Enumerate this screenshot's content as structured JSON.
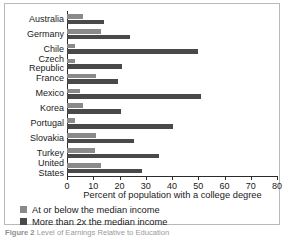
{
  "caption": {
    "prefix": "Figure 2",
    "text": " Level of Earnings Relative to Education"
  },
  "legend": {
    "items": [
      {
        "label": "At or below the median income",
        "color": "#8a8a8a",
        "swatch_name": "legend-swatch-at-or-below"
      },
      {
        "label": "More than 2x the median income",
        "color": "#494949",
        "swatch_name": "legend-swatch-more-than-2x"
      }
    ]
  },
  "chart_data": {
    "type": "bar",
    "orientation": "horizontal",
    "title": "",
    "xlabel": "Percent of population with a college degree",
    "ylabel": "",
    "xlim": [
      0,
      80
    ],
    "xticks": [
      0,
      10,
      20,
      30,
      40,
      50,
      60,
      70,
      80
    ],
    "xtick_labels": [
      "0",
      "10",
      "20",
      "30",
      "40",
      "50",
      "60",
      "70",
      "80"
    ],
    "grid": false,
    "legend_position": "below-axis-left",
    "categories": [
      "Australia",
      "Germany",
      "Chile",
      "Czech\nRepublic",
      "France",
      "Mexico",
      "Korea",
      "Portugal",
      "Slovakia",
      "Turkey",
      "United\nStates"
    ],
    "series": [
      {
        "name": "At or below the median income",
        "color": "#8a8a8a",
        "values": [
          6,
          13,
          3,
          3,
          11,
          5,
          6,
          3,
          11,
          10.5,
          13
        ]
      },
      {
        "name": "More than 2x the median income",
        "color": "#494949",
        "values": [
          14,
          24,
          50,
          21,
          19.5,
          51,
          20.5,
          40.5,
          25.5,
          35,
          28.5
        ]
      }
    ]
  }
}
